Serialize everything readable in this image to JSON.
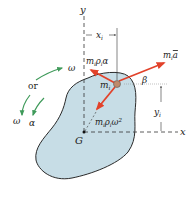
{
  "diagram": {
    "colors": {
      "body_fill": "#c7dde6",
      "body_stroke": "#2a2a2a",
      "force_arrow": "#e2422a",
      "rotation_arrow": "#3f9a5a",
      "particle": "#c08a6a",
      "axis": "#333333"
    },
    "axes": {
      "y_label": "y",
      "x_label": "x",
      "origin_label": "G"
    },
    "dimensions": {
      "x_offset": "x",
      "x_offset_sub": "i",
      "y_offset": "y",
      "y_offset_sub": "i"
    },
    "particle": {
      "label": "m",
      "label_sub": "i"
    },
    "forces": {
      "tangential": {
        "m": "m",
        "sub1": "i",
        "rho": "ρ",
        "sub2": "i",
        "rest": "α"
      },
      "total": {
        "m": "m",
        "sub": "i",
        "a": "a"
      },
      "normal": {
        "m": "m",
        "sub1": "i",
        "rho": "ρ",
        "sub2": "i",
        "rest": "ω",
        "exp": "2"
      }
    },
    "angle_label": "β",
    "rotation": {
      "omega_top": "ω",
      "or_label": "or",
      "omega_bottom": "ω",
      "alpha_label": "α"
    }
  }
}
